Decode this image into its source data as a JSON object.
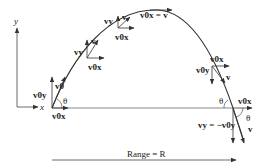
{
  "diagram": {
    "type": "projectile-motion",
    "axes": {
      "x_label": "x",
      "y_label": "y"
    },
    "labels": {
      "v0y_left": "v0y",
      "v0_launch": "v0",
      "v0x_launch": "v0x",
      "theta_launch": "θ",
      "vy_1": "vy",
      "v_1": "v",
      "v0x_1": "v0x",
      "vy_2": "vy",
      "v_2": "v",
      "v0x_2": "v0x",
      "apex": "v0x = v",
      "v0x_3": "v0x",
      "v0y_3": "v0y",
      "v_3": "v",
      "theta_land": "θ",
      "v0x_land": "v0x",
      "theta_land2": "θ",
      "vy_land": "vy = −v0y",
      "v_land": "v",
      "range": "Range = R"
    },
    "colors": {
      "ink": "#333333",
      "background": "#ffffff"
    }
  }
}
